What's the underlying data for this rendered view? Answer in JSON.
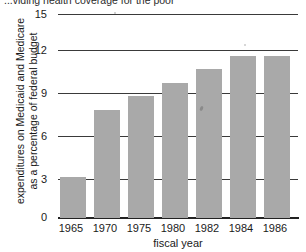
{
  "caption": {
    "text": "...viding health coverage for the poor"
  },
  "chart_data": {
    "type": "bar",
    "title": "",
    "categories": [
      "1965",
      "1970",
      "1975",
      "1980",
      "1982",
      "1984",
      "1986"
    ],
    "values": [
      3,
      8,
      9,
      10,
      11,
      12,
      12
    ],
    "xlabel": "fiscal year",
    "ylabel_line1": "expenditures on Medicaid and Medicare",
    "ylabel_line2": "as a percentage of federal budget",
    "yticks": [
      "0",
      "3",
      "6",
      "9",
      "12",
      "15"
    ],
    "ylim": [
      0,
      15
    ],
    "grid": true,
    "legend": "none",
    "bar_color": "#a9a9a9",
    "axis_color": "#222222",
    "gridline_color": "#3a3a3a"
  }
}
